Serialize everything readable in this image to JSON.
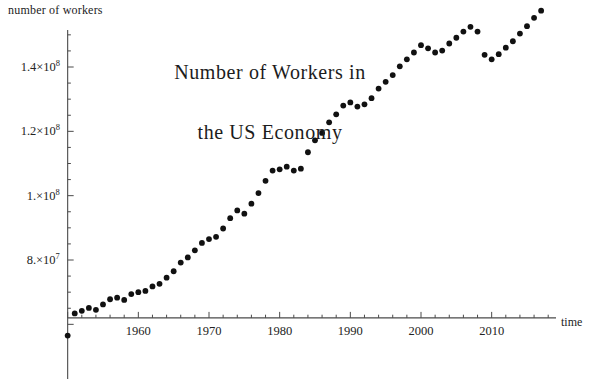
{
  "figure": {
    "title_line1": "Number of Workers in",
    "title_line2": "the US Economy",
    "title": "Number of Workers in\nthe US Economy",
    "y_axis_label": "number of workers",
    "x_axis_label": "time",
    "point_color": "#111111",
    "axis_color": "#4a4a4a"
  },
  "y_ticks": [
    {
      "value": 140000000,
      "mantissa": "1.4",
      "times": "×",
      "base": "10",
      "exponent": "8",
      "label": "1.4×10^8"
    },
    {
      "value": 120000000,
      "mantissa": "1.2",
      "times": "×",
      "base": "10",
      "exponent": "8",
      "label": "1.2×10^8"
    },
    {
      "value": 100000000,
      "mantissa": "1.",
      "times": "×",
      "base": "10",
      "exponent": "8",
      "label": "1.×10^8"
    },
    {
      "value": 80000000,
      "mantissa": "8.",
      "times": "×",
      "base": "10",
      "exponent": "7",
      "label": "8.×10^7"
    }
  ],
  "x_ticks": [
    {
      "value": 1960,
      "label": "1960"
    },
    {
      "value": 1970,
      "label": "1970"
    },
    {
      "value": 1980,
      "label": "1980"
    },
    {
      "value": 1990,
      "label": "1990"
    },
    {
      "value": 2000,
      "label": "2000"
    },
    {
      "value": 2010,
      "label": "2010"
    }
  ],
  "chart_data": {
    "type": "scatter",
    "title": "Number of Workers in the US Economy",
    "xlabel": "time",
    "ylabel": "number of workers",
    "xlim": [
      1949,
      2018.5
    ],
    "ylim": [
      56000000,
      150000000
    ],
    "grid": false,
    "legend": null,
    "axis_origin_y": 62000000,
    "x_tick_step": 10,
    "x_minor_tick_step": 2,
    "y_tick_step": 20000000,
    "y_minor_tick_step": 5000000,
    "x": [
      1950,
      1951,
      1952,
      1953,
      1954,
      1955,
      1956,
      1957,
      1958,
      1959,
      1960,
      1961,
      1962,
      1963,
      1964,
      1965,
      1966,
      1967,
      1968,
      1969,
      1970,
      1971,
      1972,
      1973,
      1974,
      1975,
      1976,
      1977,
      1978,
      1979,
      1980,
      1981,
      1982,
      1983,
      1984,
      1985,
      1986,
      1987,
      1988,
      1989,
      1990,
      1991,
      1992,
      1993,
      1994,
      1995,
      1996,
      1997,
      1998,
      1999,
      2000,
      2001,
      2002,
      2003,
      2004,
      2005,
      2006,
      2007,
      2008,
      2009,
      2010,
      2011,
      2012,
      2013,
      2014,
      2015,
      2016,
      2017
    ],
    "y": [
      56500000,
      63400000,
      64200000,
      65100000,
      64500000,
      66200000,
      67800000,
      68300000,
      67600000,
      69400000,
      70000000,
      70400000,
      71800000,
      72600000,
      74500000,
      76500000,
      79200000,
      80800000,
      83000000,
      85300000,
      86500000,
      87200000,
      89800000,
      93000000,
      95400000,
      94400000,
      97500000,
      100800000,
      104600000,
      107800000,
      108200000,
      109000000,
      107800000,
      108400000,
      113500000,
      117200000,
      119500000,
      122800000,
      125300000,
      128000000,
      129000000,
      127700000,
      128400000,
      130300000,
      133300000,
      135400000,
      137500000,
      140200000,
      142400000,
      144500000,
      146800000,
      145800000,
      144500000,
      145100000,
      147300000,
      149100000,
      151000000,
      152500000,
      151000000,
      143800000,
      142400000,
      144000000,
      146000000,
      148000000,
      150400000,
      152700000,
      155300000,
      157500000
    ]
  }
}
